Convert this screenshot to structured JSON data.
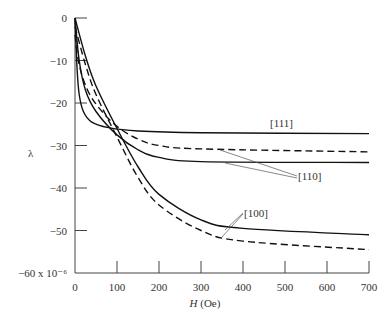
{
  "chart_data": {
    "type": "line",
    "title": "",
    "xlabel": "H (Oe)",
    "xlabel_italic": "H",
    "xlabel_unit": "(Oe)",
    "ylabel": "λ",
    "xlim": [
      0,
      700
    ],
    "ylim": [
      -60,
      0
    ],
    "y_scale_note": "× 10^-6",
    "x_ticks": [
      0,
      100,
      200,
      300,
      400,
      500,
      600,
      700
    ],
    "y_ticks": [
      0,
      -10,
      -20,
      -30,
      -40,
      -50,
      -60
    ],
    "x_tick_labels": [
      "0",
      "100",
      "200",
      "300",
      "400",
      "500",
      "600",
      "700"
    ],
    "y_tick_labels": [
      "0",
      "−10",
      "−20",
      "−30",
      "−40",
      "−50",
      "−60 x 10⁻⁶"
    ],
    "grid": false,
    "legend": "inline annotations",
    "series": [
      {
        "name": "[111] solid",
        "direction": "[111]",
        "style": "solid",
        "x": [
          0,
          5,
          10,
          20,
          40,
          80,
          150,
          300,
          700
        ],
        "values": [
          0,
          -12,
          -18,
          -22,
          -24.5,
          -25.8,
          -26.6,
          -27,
          -27.2
        ]
      },
      {
        "name": "[110] solid",
        "direction": "[110]",
        "style": "solid",
        "x": [
          0,
          10,
          25,
          50,
          100,
          150,
          200,
          300,
          700
        ],
        "values": [
          0,
          -10,
          -17,
          -22,
          -27.5,
          -31,
          -32.8,
          -33.8,
          -34
        ]
      },
      {
        "name": "[110] dashed",
        "direction": "[110]",
        "style": "dashed",
        "x": [
          0,
          10,
          30,
          60,
          100,
          150,
          200,
          300,
          700
        ],
        "values": [
          -4,
          -11,
          -17,
          -21.5,
          -25.5,
          -28.5,
          -30,
          -30.8,
          -31.5
        ]
      },
      {
        "name": "[100] solid",
        "direction": "[100]",
        "style": "solid",
        "x": [
          0,
          25,
          50,
          100,
          150,
          200,
          300,
          400,
          700
        ],
        "values": [
          0,
          -9,
          -16,
          -26,
          -35,
          -41.5,
          -47.5,
          -49.5,
          -51
        ]
      },
      {
        "name": "[100] dashed",
        "direction": "[100]",
        "style": "dashed",
        "x": [
          0,
          25,
          50,
          100,
          150,
          200,
          300,
          400,
          700
        ],
        "values": [
          -2,
          -11,
          -18,
          -28,
          -37.5,
          -44,
          -50,
          -52.5,
          -54.5
        ]
      }
    ],
    "annotations": [
      {
        "text": "[111]",
        "near_x": 430,
        "near_y": -25.5
      },
      {
        "text": "[110]",
        "near_x": 460,
        "near_y": -37,
        "arrows_to": [
          "[110] dashed",
          "[110] solid"
        ]
      },
      {
        "text": "[100]",
        "near_x": 400,
        "near_y": -46,
        "arrows_to": [
          "[100] solid",
          "[100] dashed"
        ]
      }
    ]
  },
  "labels": {
    "ylabel": "λ",
    "xlabel_var": "H",
    "xlabel_unit": " (Oe)",
    "ann_111": "[111]",
    "ann_110": "[110]",
    "ann_100": "[100]"
  }
}
